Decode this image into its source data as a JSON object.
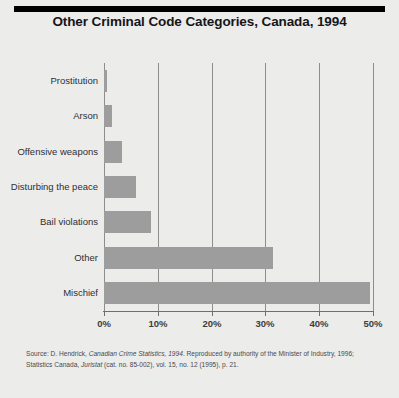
{
  "figure": {
    "title": "Other Criminal Code Categories, Canada, 1994",
    "panel_color": "#ececeb",
    "rule_color": "#000000",
    "bar_color": "#9d9d9d",
    "grid_color": "#8d8d8d"
  },
  "source": {
    "line1_prefix": "Source: D. Hendrick, ",
    "line1_italic": "Canadian Crime Statistics, 1994",
    "line1_suffix": ". Reproduced by authority of the Minister of Industry, 1996;",
    "line2_prefix": "Statistics Canada, ",
    "line2_italic": "Juristat",
    "line2_suffix": " (cat. no. 85-002), vol. 15, no. 12 (1995), p. 21."
  },
  "chart_data": {
    "type": "bar",
    "orientation": "horizontal",
    "title": "Other Criminal Code Categories, Canada, 1994",
    "xlabel": "",
    "ylabel": "",
    "xlim": [
      0,
      50
    ],
    "xticks": [
      0,
      10,
      20,
      30,
      40,
      50
    ],
    "xtick_labels": [
      "0%",
      "10%",
      "20%",
      "30%",
      "40%",
      "50%"
    ],
    "grid": true,
    "legend": false,
    "categories": [
      "Prostitution",
      "Arson",
      "Offensive weapons",
      "Disturbing the peace",
      "Bail violations",
      "Other",
      "Mischief"
    ],
    "values": [
      0.5,
      1.5,
      3.3,
      6.0,
      8.7,
      31.5,
      49.5
    ]
  }
}
